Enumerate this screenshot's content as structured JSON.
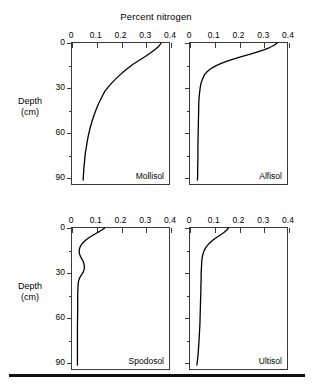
{
  "chart_data": {
    "type": "line",
    "title": "Percent nitrogen",
    "xlabel": "Percent nitrogen",
    "ylabel": "Depth (cm)",
    "xlim": [
      0,
      0.4
    ],
    "ylim": [
      0,
      95
    ],
    "y_inverted": true,
    "grid": false,
    "legend": "none",
    "layout": "2x2 grid of small-multiple depth profiles",
    "xticks": [
      0,
      0.1,
      0.2,
      0.3,
      0.4
    ],
    "xticklabels": [
      "0",
      "0.1",
      "0.2",
      "0.3",
      "0.4"
    ],
    "yticks": [
      0,
      30,
      60,
      90
    ],
    "yticklabels": [
      "0",
      "30",
      "60",
      "90"
    ],
    "yminorticks": [
      15,
      45,
      75
    ],
    "panels": [
      {
        "name": "Mollisol",
        "row": 0,
        "col": 0,
        "x": [
          0.36,
          0.352,
          0.338,
          0.318,
          0.296,
          0.272,
          0.248,
          0.224,
          0.202,
          0.182,
          0.164,
          0.148,
          0.133,
          0.12,
          0.108,
          0.098,
          0.089,
          0.081,
          0.074,
          0.068,
          0.063,
          0.059,
          0.055,
          0.052,
          0.05,
          0.048,
          0.047,
          0.046,
          0.045
        ],
        "y": [
          0,
          2,
          4,
          6.5,
          9,
          11.5,
          14,
          17,
          20,
          23,
          26,
          29,
          32,
          36,
          40,
          44,
          48,
          52,
          56,
          60,
          64,
          68,
          72,
          76,
          80,
          83,
          86,
          88,
          91
        ]
      },
      {
        "name": "Alfisol",
        "row": 0,
        "col": 1,
        "x": [
          0.352,
          0.34,
          0.322,
          0.298,
          0.27,
          0.24,
          0.208,
          0.178,
          0.15,
          0.126,
          0.106,
          0.09,
          0.077,
          0.067,
          0.059,
          0.053,
          0.048,
          0.044,
          0.041,
          0.038,
          0.036,
          0.035,
          0.034,
          0.033,
          0.032,
          0.032,
          0.031,
          0.031,
          0.03
        ],
        "y": [
          0,
          1.5,
          3,
          4.5,
          6,
          7.5,
          9,
          10.5,
          12,
          13.5,
          15,
          16.5,
          18,
          19.5,
          21,
          23,
          25,
          27,
          30,
          34,
          38,
          44,
          52,
          60,
          68,
          76,
          83,
          88,
          91
        ]
      },
      {
        "name": "Spodosol",
        "row": 1,
        "col": 0,
        "x": [
          0.132,
          0.124,
          0.112,
          0.098,
          0.083,
          0.068,
          0.056,
          0.046,
          0.038,
          0.033,
          0.03,
          0.029,
          0.03,
          0.033,
          0.038,
          0.043,
          0.047,
          0.049,
          0.05,
          0.049,
          0.046,
          0.041,
          0.035,
          0.03,
          0.027,
          0.025,
          0.024,
          0.023,
          0.023,
          0.022,
          0.022,
          0.022
        ],
        "y": [
          0,
          1,
          2.2,
          3.5,
          5,
          6.5,
          8,
          9.5,
          11,
          12.5,
          14,
          15.5,
          17,
          18.5,
          20,
          21.5,
          23,
          24.5,
          26,
          27.5,
          29,
          30.5,
          32,
          33.5,
          35,
          37,
          40,
          45,
          55,
          65,
          78,
          91
        ]
      },
      {
        "name": "Ultisol",
        "row": 1,
        "col": 1,
        "x": [
          0.155,
          0.148,
          0.137,
          0.124,
          0.11,
          0.097,
          0.086,
          0.076,
          0.068,
          0.062,
          0.057,
          0.053,
          0.05,
          0.048,
          0.047,
          0.046,
          0.045,
          0.045,
          0.044,
          0.044,
          0.043,
          0.042,
          0.041,
          0.04,
          0.038,
          0.036,
          0.034,
          0.032,
          0.03,
          0.028
        ],
        "y": [
          0,
          1.5,
          3,
          4.5,
          6,
          7.5,
          9,
          10.5,
          12,
          13.5,
          15,
          17,
          19,
          21,
          24,
          27,
          30,
          34,
          38,
          42,
          46,
          52,
          58,
          64,
          70,
          76,
          81,
          85,
          88,
          91
        ]
      }
    ]
  },
  "title": "Percent nitrogen",
  "axis": {
    "depth_label_line1": "Depth",
    "depth_label_line2": "(cm)"
  }
}
